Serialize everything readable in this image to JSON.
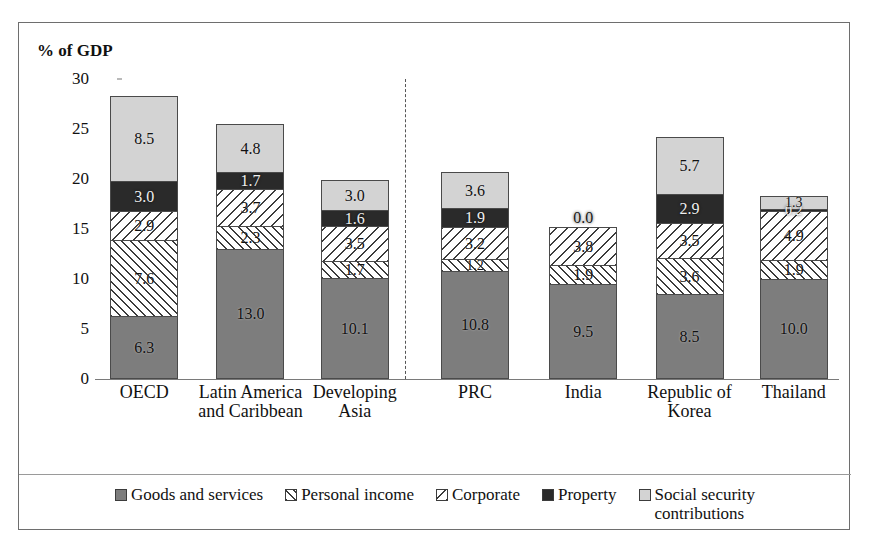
{
  "artifact_text": "",
  "chart_data": {
    "type": "bar",
    "subtype": "stacked-bar",
    "title": "",
    "xlabel": "",
    "ylabel": "% of GDP",
    "ylim": [
      0,
      30
    ],
    "yticks": [
      "0",
      "5",
      "10",
      "15",
      "20",
      "25",
      "30"
    ],
    "grid": false,
    "legend_position": "bottom",
    "categories": [
      "OECD",
      "Latin America\nand Caribbean",
      "Developing\nAsia",
      "PRC",
      "India",
      "Republic of\nKorea",
      "Thailand"
    ],
    "divider_after_category_index": 2,
    "series": [
      {
        "name": "Goods and services",
        "fill": "fill-goods",
        "color": "#7d7d7d",
        "values": [
          6.3,
          13.0,
          10.1,
          10.8,
          9.5,
          8.5,
          10.0
        ]
      },
      {
        "name": "Personal income",
        "fill": "fill-personal",
        "color": "#ffffff",
        "values": [
          7.6,
          2.3,
          1.7,
          1.2,
          1.9,
          3.6,
          1.9
        ]
      },
      {
        "name": "Corporate",
        "fill": "fill-corporate",
        "color": "#ffffff",
        "values": [
          2.9,
          3.7,
          3.5,
          3.2,
          3.8,
          3.5,
          4.9
        ]
      },
      {
        "name": "Property",
        "fill": "fill-property",
        "color": "#2a2a2a",
        "values": [
          3.0,
          1.7,
          1.6,
          1.9,
          0.0,
          2.9,
          0.2
        ]
      },
      {
        "name": "Social security contributions",
        "fill": "fill-social",
        "color": "#d3d3d3",
        "values": [
          8.5,
          4.8,
          3.0,
          3.6,
          0.0,
          5.7,
          1.3
        ]
      }
    ],
    "totals": [
      28.3,
      25.5,
      19.9,
      20.7,
      15.2,
      24.2,
      18.3
    ],
    "legend": [
      "Goods and services",
      "Personal income",
      "Corporate",
      "Property",
      "Social security\ncontributions"
    ]
  }
}
